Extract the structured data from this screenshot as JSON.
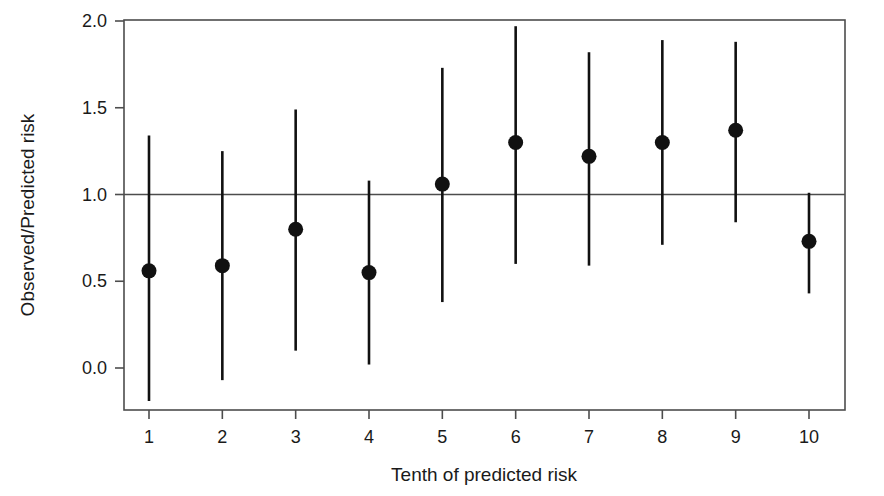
{
  "chart_data": {
    "type": "scatter",
    "title": "",
    "xlabel": "Tenth of predicted risk",
    "ylabel": "Observed/Predicted risk",
    "categories": [
      "1",
      "2",
      "3",
      "4",
      "5",
      "6",
      "7",
      "8",
      "9",
      "10"
    ],
    "x": [
      1,
      2,
      3,
      4,
      5,
      6,
      7,
      8,
      9,
      10
    ],
    "values": [
      0.56,
      0.59,
      0.8,
      0.55,
      1.06,
      1.3,
      1.22,
      1.3,
      1.37,
      0.73
    ],
    "error_upper": [
      1.34,
      1.25,
      1.49,
      1.08,
      1.73,
      1.97,
      1.82,
      1.89,
      1.88,
      1.01
    ],
    "error_lower": [
      -0.19,
      -0.07,
      0.1,
      0.02,
      0.38,
      0.6,
      0.59,
      0.71,
      0.84,
      0.43
    ],
    "reference_line_y": 1.0,
    "ylim": [
      -0.25,
      2.05
    ],
    "xlim": [
      0.6,
      10.4
    ],
    "yticks": [
      0.0,
      0.5,
      1.0,
      1.5,
      2.0
    ],
    "ytick_labels": [
      "0.0",
      "0.5",
      "1.0",
      "1.5",
      "2.0"
    ],
    "xticks": [
      1,
      2,
      3,
      4,
      5,
      6,
      7,
      8,
      9,
      10
    ],
    "xtick_labels": [
      "1",
      "2",
      "3",
      "4",
      "5",
      "6",
      "7",
      "8",
      "9",
      "10"
    ],
    "grid": false,
    "legend": "none",
    "marker": "filled-circle",
    "series_name": "Observed/Predicted risk by tenth",
    "colors": {
      "marker": "#111111",
      "whisker": "#111111",
      "axis": "#4d4d4d",
      "background": "#ffffff"
    }
  },
  "plot_area": {
    "left": 124,
    "right": 845,
    "top": 20,
    "bottom": 410
  }
}
